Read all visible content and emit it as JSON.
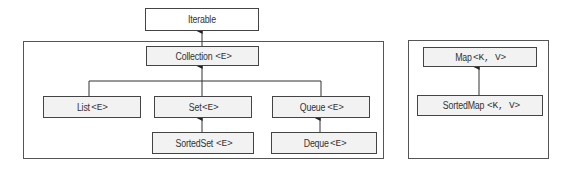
{
  "diagram": {
    "nodes": {
      "iterable": {
        "name": "Iterable",
        "generic": ""
      },
      "collection": {
        "name": "Collection",
        "generic": "<E>"
      },
      "list": {
        "name": "List",
        "generic": "<E>"
      },
      "set": {
        "name": "Set",
        "generic": "<E>"
      },
      "queue": {
        "name": "Queue",
        "generic": "<E>"
      },
      "sortedset": {
        "name": "SortedSet",
        "generic": "<E>"
      },
      "deque": {
        "name": "Deque",
        "generic": "<E>"
      },
      "map": {
        "name": "Map",
        "generic": "<K, V>"
      },
      "sortedmap": {
        "name": "SortedMap",
        "generic": "<K, V>"
      }
    },
    "edges": [
      {
        "from": "collection",
        "to": "iterable"
      },
      {
        "from": "list",
        "to": "collection"
      },
      {
        "from": "set",
        "to": "collection"
      },
      {
        "from": "queue",
        "to": "collection"
      },
      {
        "from": "sortedset",
        "to": "set"
      },
      {
        "from": "deque",
        "to": "queue"
      },
      {
        "from": "sortedmap",
        "to": "map"
      }
    ],
    "colors": {
      "line": "#333333",
      "box_fill": "#f2f2f2",
      "frame": "#555555"
    }
  }
}
